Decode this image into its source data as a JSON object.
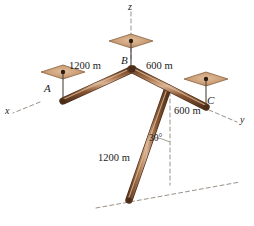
{
  "figure": {
    "type": "engineering-statics-diagram",
    "colors": {
      "member_dark": "#6b4226",
      "member_mid": "#8a5a36",
      "member_light": "#c69a72",
      "member_outline": "#4a2c18",
      "plate_fill": "#c89b74",
      "plate_edge": "#8a6344",
      "plate_dot": "#2b1a0e",
      "dashed": "#a09890",
      "text": "#1a1a1a"
    },
    "axes": [
      {
        "name": "x-axis-label",
        "label": "x"
      },
      {
        "name": "y-axis-label",
        "label": "y"
      },
      {
        "name": "z-axis-label",
        "label": "z"
      }
    ],
    "joints": [
      {
        "name": "joint-a-label",
        "label": "A"
      },
      {
        "name": "joint-b-label",
        "label": "B"
      },
      {
        "name": "joint-c-label",
        "label": "C"
      }
    ],
    "dimensions": [
      {
        "name": "dim-ab",
        "label": "1200 m"
      },
      {
        "name": "dim-bc-upper",
        "label": "600 m"
      },
      {
        "name": "dim-bc-lower",
        "label": "600 m"
      },
      {
        "name": "dim-bd",
        "label": "1200 m"
      }
    ],
    "angles": [
      {
        "name": "angle-30",
        "label": "30°"
      }
    ]
  }
}
